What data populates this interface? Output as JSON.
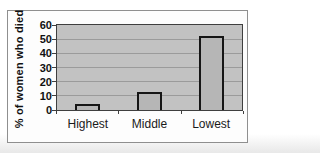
{
  "chart_data": {
    "type": "bar",
    "categories": [
      "Highest",
      "Middle",
      "Lowest"
    ],
    "values": [
      4,
      13,
      52
    ],
    "title": "",
    "xlabel": "",
    "ylabel": "% of women who died",
    "ylim": [
      0,
      60
    ],
    "yticks": [
      0,
      10,
      20,
      30,
      40,
      50,
      60
    ],
    "grid": true,
    "legend": false,
    "colors": {
      "plot_background": "#c2c2c2",
      "bar_fill": "#b6b6b6",
      "bar_border": "#161616",
      "gridline": "#9b9b9b",
      "frame_border": "#8f8f8f",
      "text": "#111111"
    }
  }
}
